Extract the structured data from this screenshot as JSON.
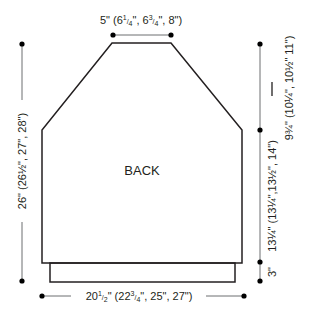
{
  "title": "BACK",
  "labels": {
    "neck_width": {
      "main": "5\"",
      "paren_open": " (6",
      "s1n": "1",
      "s1d": "4",
      "mid1": "\", 6",
      "s2n": "3",
      "s2d": "4",
      "rest": "\", 8\")"
    },
    "total_length": {
      "text": "26\" (26½\", 27\", 28\")"
    },
    "armhole_depth": {
      "text": "9¾\" (10¼\", 10½\" 11\")"
    },
    "body_length": {
      "text": "13¼\" (13¼\",13½\", 14\")"
    },
    "ribbing_height": {
      "text": "3\""
    },
    "width": {
      "main": "20",
      "s0n": "1",
      "s0d": "2",
      "paren_open": "\" (22",
      "s1n": "3",
      "s1d": "4",
      "rest": "\", 25\", 27\")"
    }
  },
  "colors": {
    "outline": "#231f20",
    "dimension_line": "#6d6e71",
    "dot": "#000000"
  }
}
